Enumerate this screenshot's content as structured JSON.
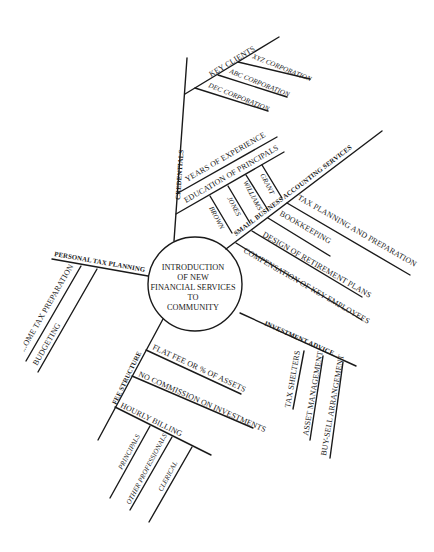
{
  "center": {
    "lines": [
      "INTRODUCTION",
      "OF NEW",
      "FINANCIAL SERVICES",
      "TO",
      "COMMUNITY"
    ]
  },
  "branches": {
    "credentials": {
      "label": "CREDENTIALS",
      "key_clients": {
        "label": "KEY CLIENTS",
        "items": [
          "XYZ CORPORATION",
          "ABC CORPORATION",
          "DEC CORPORATION"
        ]
      },
      "years": {
        "label": "YEARS OF EXPERIENCE"
      },
      "education": {
        "label": "EDUCATION OF PRINCIPALS",
        "items": [
          "BROWN",
          "JONES",
          "WILLIAMS",
          "GRANT"
        ]
      }
    },
    "small_business": {
      "label": "SMALL BUSINESS ACCOUNTING SERVICES",
      "items": [
        "TAX PLANNING AND PREPARATION",
        "BOOKKEEPING",
        "DESIGN OF RETIREMENT PLANS",
        "COMPENSATION OF KEY EMPLOYEES"
      ]
    },
    "investment": {
      "label": "INVESTMENT ADVICE",
      "items": [
        "TAX SHELTERS",
        "ASSET MANAGEMENT",
        "BUY-SELL ARRANGEMENT"
      ]
    },
    "fee": {
      "label": "FEE STRUCTURE",
      "items": [
        "FLAT FEE OR % OF ASSETS",
        "NO COMMISSION ON INVESTMENTS"
      ],
      "hourly": {
        "label": "HOURLY BILLING",
        "items": [
          "PRINCIPALS",
          "OTHER PROFESSIONALS",
          "CLERICAL"
        ]
      }
    },
    "personal_tax": {
      "label": "PERSONAL TAX PLANNING",
      "items": [
        "...OME TAX PREPARATION",
        "BUDGETING"
      ]
    }
  }
}
